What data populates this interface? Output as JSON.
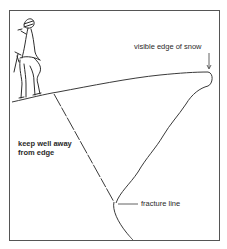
{
  "diagram": {
    "type": "cornice-hazard-illustration",
    "labels": {
      "visible_edge": "visible edge of snow",
      "keep_away_line1": "keep well away",
      "keep_away_line2": "from edge",
      "fracture": "fracture line"
    },
    "colors": {
      "ink": "#3a3a3a",
      "frame": "#555555",
      "background": "#ffffff"
    }
  }
}
